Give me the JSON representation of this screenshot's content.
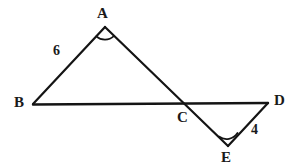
{
  "figure": {
    "background_color": "#ffffff",
    "stroke_color": "#141414",
    "label_color": "#1a1a1a",
    "stroke_width": 2.2,
    "width": 299,
    "height": 166,
    "vertices": [
      {
        "name": "A",
        "label": "A",
        "x": 105,
        "y": 27,
        "label_x": 97,
        "label_y": 6
      },
      {
        "name": "B",
        "label": "B",
        "x": 33,
        "y": 104,
        "label_x": 14,
        "label_y": 95
      },
      {
        "name": "C",
        "label": "C",
        "x": 185,
        "y": 104,
        "label_x": 177,
        "label_y": 110
      },
      {
        "name": "D",
        "label": "D",
        "x": 268,
        "y": 103,
        "label_x": 274,
        "label_y": 93
      },
      {
        "name": "E",
        "label": "E",
        "x": 228,
        "y": 146,
        "label_x": 221,
        "label_y": 150
      }
    ],
    "segments": [
      {
        "name": "segment-AB",
        "from": "B",
        "to": "A"
      },
      {
        "name": "segment-BD",
        "from": "B",
        "to": "D"
      },
      {
        "name": "segment-AE",
        "from": "A",
        "to": "E"
      },
      {
        "name": "segment-DE",
        "from": "D",
        "to": "E"
      }
    ],
    "side_labels": [
      {
        "name": "length-AB",
        "text": "6",
        "side": "AB",
        "x": 53,
        "y": 44
      },
      {
        "name": "length-DE",
        "text": "4",
        "side": "DE",
        "x": 251,
        "y": 123
      }
    ],
    "angle_marks": [
      {
        "name": "angle-arc-A",
        "at": "A",
        "radius": 13
      },
      {
        "name": "angle-arc-E",
        "at": "E",
        "radius": 13
      }
    ]
  }
}
